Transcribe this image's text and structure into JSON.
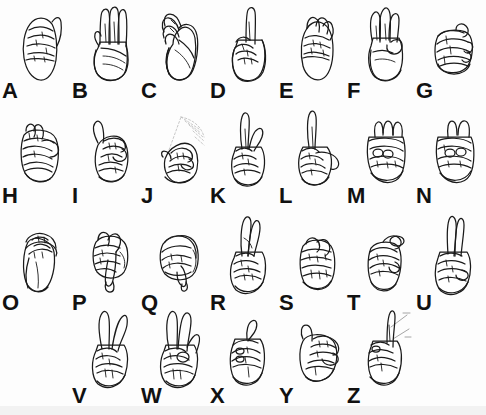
{
  "chart": {
    "style": "line-drawing",
    "ink_color": "#1a1a1a",
    "background_color": "#ffffff",
    "band_color": "#f2f2f2",
    "rows": 4,
    "columns": 7,
    "total_signs": 26
  },
  "rows": [
    {
      "index": 1,
      "start_column": 1,
      "cells": [
        {
          "letter": "A",
          "icon": "asl-hand-a-icon",
          "left": 0
        },
        {
          "letter": "B",
          "icon": "asl-hand-b-icon",
          "left": 70
        },
        {
          "letter": "C",
          "icon": "asl-hand-c-icon",
          "left": 139
        },
        {
          "letter": "D",
          "icon": "asl-hand-d-icon",
          "left": 208
        },
        {
          "letter": "E",
          "icon": "asl-hand-e-icon",
          "left": 277
        },
        {
          "letter": "F",
          "icon": "asl-hand-f-icon",
          "left": 345
        },
        {
          "letter": "G",
          "icon": "asl-hand-g-icon",
          "left": 414
        }
      ]
    },
    {
      "index": 2,
      "start_column": 1,
      "cells": [
        {
          "letter": "H",
          "icon": "asl-hand-h-icon",
          "left": 0
        },
        {
          "letter": "I",
          "icon": "asl-hand-i-icon",
          "left": 70
        },
        {
          "letter": "J",
          "icon": "asl-hand-j-icon",
          "left": 139
        },
        {
          "letter": "K",
          "icon": "asl-hand-k-icon",
          "left": 208
        },
        {
          "letter": "L",
          "icon": "asl-hand-l-icon",
          "left": 277
        },
        {
          "letter": "M",
          "icon": "asl-hand-m-icon",
          "left": 345
        },
        {
          "letter": "N",
          "icon": "asl-hand-n-icon",
          "left": 414
        }
      ]
    },
    {
      "index": 3,
      "start_column": 1,
      "cells": [
        {
          "letter": "O",
          "icon": "asl-hand-o-icon",
          "left": 0
        },
        {
          "letter": "P",
          "icon": "asl-hand-p-icon",
          "left": 70
        },
        {
          "letter": "Q",
          "icon": "asl-hand-q-icon",
          "left": 139
        },
        {
          "letter": "R",
          "icon": "asl-hand-r-icon",
          "left": 208
        },
        {
          "letter": "S",
          "icon": "asl-hand-s-icon",
          "left": 277
        },
        {
          "letter": "T",
          "icon": "asl-hand-t-icon",
          "left": 345
        },
        {
          "letter": "U",
          "icon": "asl-hand-u-icon",
          "left": 414
        }
      ]
    },
    {
      "index": 4,
      "start_column": 2,
      "cells": [
        {
          "letter": "V",
          "icon": "asl-hand-v-icon",
          "left": 70
        },
        {
          "letter": "W",
          "icon": "asl-hand-w-icon",
          "left": 139
        },
        {
          "letter": "X",
          "icon": "asl-hand-x-icon",
          "left": 208
        },
        {
          "letter": "Y",
          "icon": "asl-hand-y-icon",
          "left": 277
        },
        {
          "letter": "Z",
          "icon": "asl-hand-z-icon",
          "left": 345
        }
      ]
    }
  ]
}
